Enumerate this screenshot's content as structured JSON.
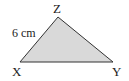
{
  "triangle": {
    "fill": "#d9d9d9",
    "stroke": "#333333",
    "vertices": {
      "X": {
        "label": "X"
      },
      "Y": {
        "label": "Y"
      },
      "Z": {
        "label": "Z"
      }
    },
    "side_xz": {
      "label": "6 cm"
    }
  }
}
